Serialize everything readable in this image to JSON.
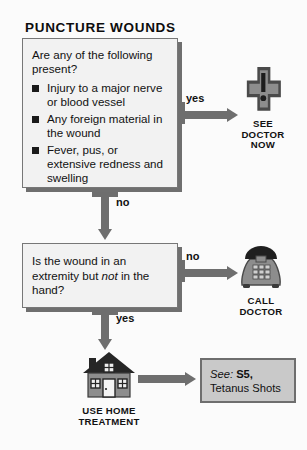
{
  "page": {
    "title": "PUNCTURE WOUNDS"
  },
  "flowchart": {
    "type": "decision-flowchart",
    "question1": {
      "lead": "Are any of the following present?",
      "bullets": [
        "Injury to a major nerve or blood vessel",
        "Any foreign material in the wound",
        "Fever, pus, or extensive redness and swelling"
      ],
      "yes_label": "yes",
      "no_label": "no"
    },
    "question2": {
      "text_part1": "Is the wound in an extremity but ",
      "text_emphasis": "not",
      "text_part2": " in the hand?",
      "yes_label": "yes",
      "no_label": "no"
    },
    "outcomes": [
      {
        "icon": "medical-cross-exclamation-icon",
        "caption_lines": [
          "SEE",
          "DOCTOR",
          "NOW"
        ]
      },
      {
        "icon": "telephone-icon",
        "caption_lines": [
          "CALL",
          "DOCTOR"
        ]
      },
      {
        "icon": "house-icon",
        "caption_lines": [
          "USE HOME",
          "TREATMENT"
        ]
      }
    ],
    "see_also": {
      "see_word": "See:",
      "reference": "S5,",
      "topic": "Tetanus Shots"
    }
  },
  "colors": {
    "arrow_gray": "#6e6e6e",
    "box_fill": "#f2f2f2",
    "box_border": "#777777",
    "icon_mid_gray": "#8d8d8d",
    "icon_dark": "#2b2b2b",
    "see_box_fill": "#c9c9c9",
    "text": "#111111"
  }
}
